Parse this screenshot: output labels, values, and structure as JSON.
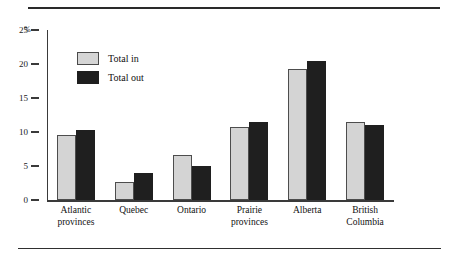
{
  "figure": {
    "cropped_title_fragment": "",
    "axis_unit_label": "%"
  },
  "legend": {
    "position": "inside-top-left",
    "items": [
      {
        "label": "Total in",
        "color": "#d4d4d4",
        "icon": "square-swatch-icon"
      },
      {
        "label": "Total out",
        "color": "#1f1f1f",
        "icon": "square-swatch-icon"
      }
    ]
  },
  "yaxis": {
    "ticks": [
      "25",
      "20",
      "15",
      "10",
      "5",
      "0"
    ],
    "unit": "%"
  },
  "chart_data": {
    "type": "bar",
    "title": "",
    "xlabel": "",
    "ylabel": "%",
    "ylim": [
      0,
      25
    ],
    "yticks": [
      0,
      5,
      10,
      15,
      20,
      25
    ],
    "grid": false,
    "legend_position": "upper left inside",
    "categories": [
      "Atlantic provinces",
      "Quebec",
      "Ontario",
      "Prairie provinces",
      "Alberta",
      "British Columbia"
    ],
    "category_lines": [
      [
        "Atlantic",
        "provinces"
      ],
      [
        "Quebec"
      ],
      [
        "Ontario"
      ],
      [
        "Prairie",
        "provinces"
      ],
      [
        "Alberta"
      ],
      [
        "British",
        "Columbia"
      ]
    ],
    "series": [
      {
        "name": "Total in",
        "color": "#d4d4d4",
        "values": [
          9.6,
          2.6,
          6.6,
          10.7,
          19.2,
          11.5
        ]
      },
      {
        "name": "Total out",
        "color": "#1f1f1f",
        "values": [
          10.3,
          4.0,
          5.0,
          11.5,
          20.5,
          11.1
        ]
      }
    ]
  }
}
